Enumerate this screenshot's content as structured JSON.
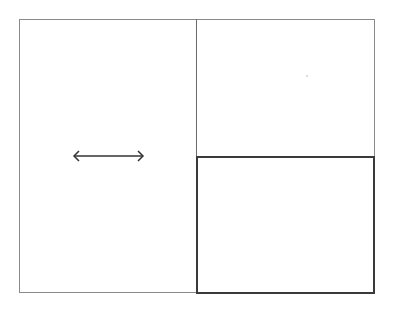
{
  "diagram": {
    "panes": [
      {
        "id": "left",
        "label": ""
      },
      {
        "id": "top-right",
        "label": ""
      },
      {
        "id": "bottom-right",
        "label": "",
        "highlighted": true
      }
    ],
    "resize_handle": {
      "icon": "horizontal-resize-arrow-icon",
      "direction": "horizontal"
    },
    "colors": {
      "border": "#8a8a8a",
      "highlight_border": "#3a3a3a",
      "arrow": "#333333",
      "background": "#ffffff"
    }
  }
}
